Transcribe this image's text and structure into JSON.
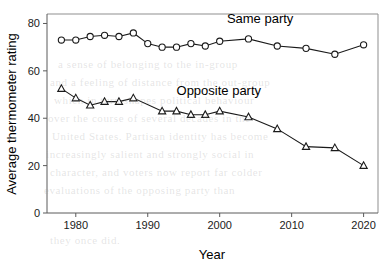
{
  "chart_data": {
    "type": "line",
    "title": "",
    "xlabel": "Year",
    "ylabel": "Average thermometer rating",
    "xlim": [
      1976,
      2022
    ],
    "ylim": [
      0,
      84
    ],
    "xticks": [
      1980,
      1990,
      2000,
      2010,
      2020
    ],
    "yticks": [
      0,
      20,
      40,
      60,
      80
    ],
    "grid": false,
    "legend_position": "inline-annotations",
    "annotations": [
      {
        "text": "Same party",
        "x": 2001,
        "y": 80
      },
      {
        "text": "Opposite party",
        "x": 1994,
        "y": 50
      }
    ],
    "series": [
      {
        "name": "Same party",
        "marker": "circle",
        "x": [
          1978,
          1980,
          1982,
          1984,
          1986,
          1988,
          1990,
          1992,
          1994,
          1996,
          1998,
          2000,
          2004,
          2008,
          2012,
          2016,
          2020
        ],
        "values": [
          73,
          73,
          74.5,
          75,
          74.5,
          76,
          71.5,
          70,
          70,
          71.5,
          70.5,
          72.5,
          73.5,
          70.5,
          69.5,
          67,
          71
        ]
      },
      {
        "name": "Opposite party",
        "marker": "triangle",
        "x": [
          1978,
          1980,
          1982,
          1984,
          1986,
          1988,
          1992,
          1994,
          1996,
          1998,
          2000,
          2004,
          2008,
          2012,
          2016,
          2020
        ],
        "values": [
          52.5,
          48.5,
          45.5,
          47,
          47,
          48.5,
          43,
          43,
          41.5,
          41.5,
          43,
          40.5,
          35.5,
          28,
          27.5,
          20
        ]
      }
    ]
  },
  "axis": {
    "x_tick_labels": [
      "1980",
      "1990",
      "2000",
      "2010",
      "2020"
    ],
    "y_tick_labels": [
      "0",
      "20",
      "40",
      "60",
      "80"
    ],
    "x_title": "Year",
    "y_title": "Average thermometer rating"
  },
  "annotations": {
    "same_party_label": "Same party",
    "opposite_party_label": "Opposite party"
  },
  "colors": {
    "line": "#1a1a1a",
    "marker_fill": "#ffffff",
    "panel_border": "#8f8f8f",
    "text": "#000000"
  },
  "background_text": {
    "lines": [
      "a sense of belonging to the in-group",
      "and a feeling of distance from the out-group",
      "which in turn shapes political behaviour",
      "over the course of several decades in the",
      "United States. Partisan identity has become",
      "increasingly salient and strongly social in",
      "character, and voters now report far colder",
      "evaluations of the opposing party than",
      "they once did."
    ]
  }
}
